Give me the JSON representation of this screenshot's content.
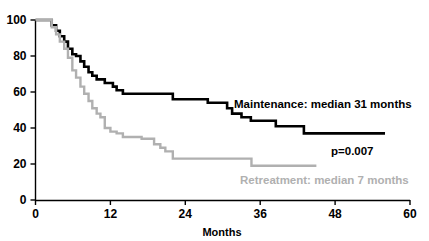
{
  "chart_data": {
    "type": "line",
    "title": "",
    "xlabel": "Months",
    "ylabel": "",
    "xlim": [
      0,
      60
    ],
    "ylim": [
      0,
      100
    ],
    "xticks": [
      0,
      12,
      24,
      36,
      48,
      60
    ],
    "xtick_labels": [
      "0",
      "12",
      "24",
      "36",
      "48",
      "60"
    ],
    "yticks": [
      0,
      20,
      40,
      60,
      80,
      100
    ],
    "ytick_labels": [
      "0",
      "20",
      "40",
      "60",
      "80",
      "100"
    ],
    "grid": false,
    "legend_position": "inline-annotations",
    "step_style": "post",
    "series": [
      {
        "name": "Maintenance",
        "color": "#000000",
        "line_width": 2.6,
        "median_months": 31,
        "label": "Maintenance: median 31 months",
        "x": [
          0,
          2.0,
          2.6,
          3.3,
          3.9,
          4.6,
          5.2,
          5.9,
          6.5,
          7.2,
          7.8,
          8.5,
          9.1,
          9.8,
          10.4,
          11.1,
          12.4,
          13.0,
          14.0,
          20.8,
          22.0,
          26.0,
          27.6,
          30.0,
          30.7,
          31.5,
          33.0,
          34.5,
          37.0,
          38.5,
          42.0,
          43.0,
          56.0
        ],
        "y": [
          100,
          100,
          97,
          94,
          91,
          88,
          84,
          81,
          80,
          77,
          74,
          71,
          69,
          67,
          67,
          65,
          63,
          61,
          59,
          59,
          56,
          56,
          54,
          54,
          51,
          48,
          46,
          44,
          44,
          41,
          41,
          37,
          37
        ]
      },
      {
        "name": "Retreatment",
        "color": "#b0b0b0",
        "line_width": 2.4,
        "median_months": 7,
        "label": "Retreatment: median 7 months",
        "x": [
          0,
          2.0,
          2.6,
          3.3,
          3.9,
          4.6,
          5.2,
          5.9,
          6.5,
          7.2,
          7.8,
          8.5,
          9.1,
          9.8,
          10.4,
          11.1,
          12.0,
          13.0,
          14.0,
          15.5,
          17.0,
          18.0,
          19.0,
          20.0,
          20.8,
          22.0,
          34.0,
          34.6,
          45.0
        ],
        "y": [
          100,
          100,
          96,
          92,
          88,
          84,
          79,
          72,
          68,
          63,
          59,
          55,
          51,
          48,
          46,
          40,
          38,
          37,
          35,
          35,
          34,
          34,
          31,
          29,
          27,
          23,
          23,
          19,
          19
        ]
      }
    ],
    "annotations": [
      {
        "id": "maintenance-label",
        "text": "Maintenance: median 31 months",
        "color": "#000000",
        "x_px": 234,
        "y_px": 108
      },
      {
        "id": "pvalue-label",
        "text": "p=0.007",
        "color": "#000000",
        "x_px": 331,
        "y_px": 155
      },
      {
        "id": "retreatment-label",
        "text": "Retreatment: median 7 months",
        "color": "#b0b0b0",
        "x_px": 240,
        "y_px": 184
      }
    ]
  },
  "axes": {
    "months_label": "Months"
  }
}
